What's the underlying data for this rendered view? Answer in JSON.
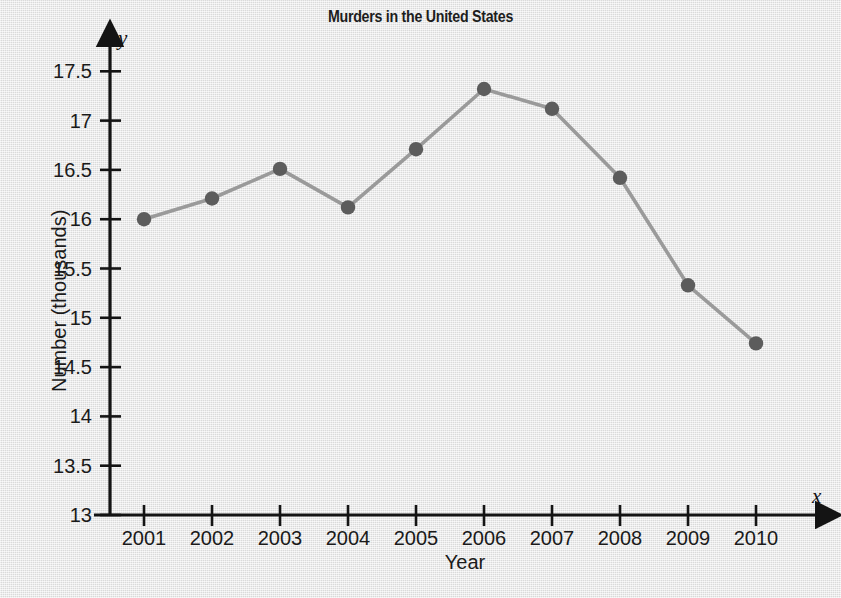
{
  "chart_data": {
    "type": "line",
    "title": "Murders in the United States",
    "xlabel": "Year",
    "ylabel": "Number (thousands)",
    "x_axis_symbol": "x",
    "y_axis_symbol": "y",
    "categories": [
      "2001",
      "2002",
      "2003",
      "2004",
      "2005",
      "2006",
      "2007",
      "2008",
      "2009",
      "2010"
    ],
    "values": [
      16.0,
      16.21,
      16.51,
      16.12,
      16.71,
      17.32,
      17.12,
      16.42,
      15.33,
      14.74
    ],
    "x": [
      2001,
      2002,
      2003,
      2004,
      2005,
      2006,
      2007,
      2008,
      2009,
      2010
    ],
    "y_ticks": [
      "13",
      "13.5",
      "14",
      "14.5",
      "15",
      "15.5",
      "16",
      "16.5",
      "17",
      "17.5"
    ],
    "y_tick_values": [
      13,
      13.5,
      14,
      14.5,
      15,
      15.5,
      16,
      16.5,
      17,
      17.5
    ],
    "ylim": [
      13,
      17.6
    ],
    "xlim": [
      2000.5,
      2010.9
    ],
    "grid": false,
    "legend": false,
    "marker": "circle",
    "marker_color": "#5c5c5c",
    "line_color": "#9a9a9a",
    "axis_color": "#141414",
    "background_color": "#e4e4e4",
    "text_color": "#1a1a1a"
  }
}
